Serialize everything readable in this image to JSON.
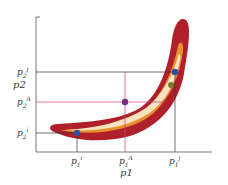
{
  "diagram": {
    "type": "likelihood-contour",
    "axes": {
      "x_label": "p1",
      "y_label": "p2"
    },
    "x_ticks": [
      {
        "id": "i",
        "label_base": "p",
        "label_sub": "1",
        "label_sup": "i"
      },
      {
        "id": "A",
        "label_base": "p",
        "label_sub": "1",
        "label_sup": "A"
      },
      {
        "id": "j",
        "label_base": "p",
        "label_sub": "1",
        "label_sup": "j"
      }
    ],
    "y_ticks": [
      {
        "id": "j",
        "label_base": "p",
        "label_sub": "2",
        "label_sup": "j"
      },
      {
        "id": "A",
        "label_base": "p",
        "label_sub": "2",
        "label_sup": "A"
      },
      {
        "id": "i",
        "label_base": "p",
        "label_sub": "2",
        "label_sup": "i"
      }
    ],
    "points": [
      {
        "id": "i",
        "color": "#2d4f9e"
      },
      {
        "id": "A",
        "color": "#7a2a8a"
      },
      {
        "id": "j",
        "color": "#2d4f9e"
      },
      {
        "id": "extra",
        "color": "#7a7a2a"
      }
    ],
    "colors": {
      "outer_band": "#b0202a",
      "middle_band": "#e8902f",
      "inner_band": "#f7e3c0",
      "guide_line_i_j": "#333333",
      "guide_line_A": "#c0407a"
    }
  }
}
